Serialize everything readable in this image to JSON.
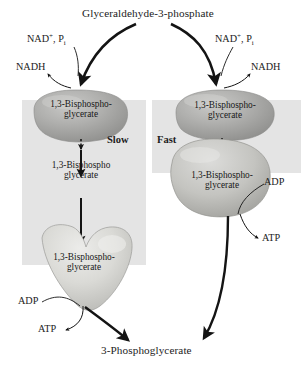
{
  "diagram": {
    "title": "Glyceraldehyde-3-phosphate",
    "product": "3-Phosphoglycerate",
    "rate_left": "Slow",
    "rate_right": "Fast",
    "cofactors_in": "NAD+, Pi",
    "cofactor_out": "NADH",
    "adp": "ADP",
    "atp": "ATP",
    "substrate_hyphen": "1,3-Bisphospho-",
    "substrate_hyphen_line2": "glycerate",
    "substrate_plain": "1,3-Bisphospho",
    "substrate_plain_line2": "glycerate"
  },
  "left_pathway": {
    "rate_label": "Slow",
    "nad_in": "NAD+, Pi",
    "nadh_out": "NADH",
    "adp_in": "ADP",
    "atp_out": "ATP",
    "intermediates": [
      {
        "line1": "1,3-Bisphospho-",
        "line2": "glycerate",
        "on_enzyme": true
      },
      {
        "line1": "1,3-Bisphospho",
        "line2": "glycerate",
        "on_enzyme": false
      },
      {
        "line1": "1,3-Bisphospho-",
        "line2": "glycerate",
        "on_enzyme": true
      }
    ]
  },
  "right_pathway": {
    "rate_label": "Fast",
    "nad_in": "NAD+, Pi",
    "nadh_out": "NADH",
    "adp_in": "ADP",
    "atp_out": "ATP",
    "intermediates": [
      {
        "line1": "1,3-Bisphospho-",
        "line2": "glycerate",
        "on_enzyme": true
      },
      {
        "line1": "1,3-Bisphospho-",
        "line2": "glycerate",
        "on_enzyme": true
      }
    ]
  },
  "colors": {
    "band": "#e4e4e4",
    "blob_fill": "#a9a9a9",
    "blob_light": "#d8d8d6",
    "ink": "#1a1a1a"
  }
}
